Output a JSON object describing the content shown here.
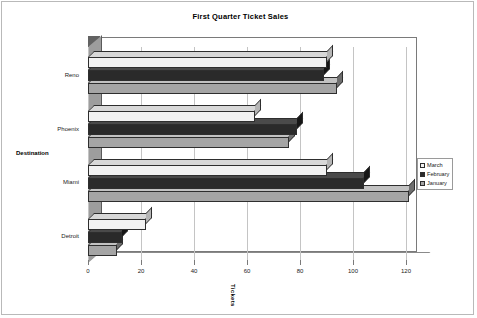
{
  "chart_data": {
    "type": "bar",
    "orientation": "horizontal",
    "title": "First Quarter Ticket Sales",
    "xlabel": "Tickets",
    "ylabel": "Destination",
    "categories": [
      "Reno",
      "Phoenix",
      "Miami",
      "Detroit"
    ],
    "series": [
      {
        "name": "March",
        "color": "#f2f2f2",
        "values": [
          90,
          63,
          90,
          22
        ]
      },
      {
        "name": "February",
        "color": "#2a2a2a",
        "values": [
          89,
          79,
          104,
          13
        ]
      },
      {
        "name": "January",
        "color": "#a5a5a5",
        "values": [
          94,
          76,
          121,
          11
        ]
      }
    ],
    "xlim": [
      0,
      120
    ],
    "xticks": [
      0,
      20,
      40,
      60,
      80,
      100,
      120
    ],
    "xtick_labels": [
      "0",
      "20",
      "40",
      "60",
      "80",
      "100",
      "120"
    ],
    "grid": true,
    "grid_axis": "x",
    "legend_position": "right",
    "style": "3d-bar",
    "series_order_top_to_bottom": [
      "March",
      "February",
      "January"
    ]
  },
  "legend": {
    "entries": [
      {
        "label": "March"
      },
      {
        "label": "February"
      },
      {
        "label": "January"
      }
    ]
  }
}
